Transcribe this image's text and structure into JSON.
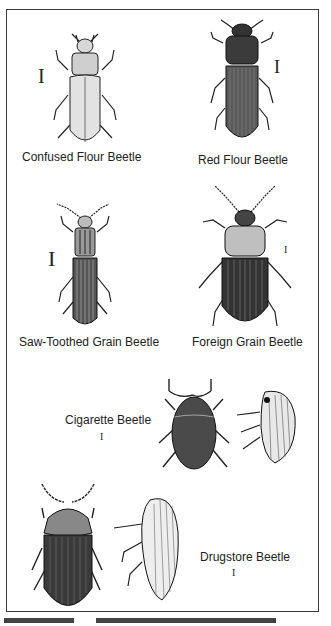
{
  "figure": {
    "beetles": [
      {
        "name": "Confused Flour Beetle",
        "view": "dorsal",
        "shading": "light"
      },
      {
        "name": "Red Flour Beetle",
        "view": "dorsal",
        "shading": "dark"
      },
      {
        "name": "Saw-Toothed Grain Beetle",
        "view": "dorsal",
        "shading": "striated"
      },
      {
        "name": "Foreign Grain Beetle",
        "view": "dorsal",
        "shading": "dark"
      },
      {
        "name": "Cigarette Beetle",
        "view": "dorsal and lateral",
        "shading": "stippled"
      },
      {
        "name": "Drugstore Beetle",
        "view": "dorsal and lateral",
        "shading": "striated"
      }
    ],
    "scale_bar_glyph": "I",
    "caption_partial": "(text cut off at bottom edge)"
  }
}
